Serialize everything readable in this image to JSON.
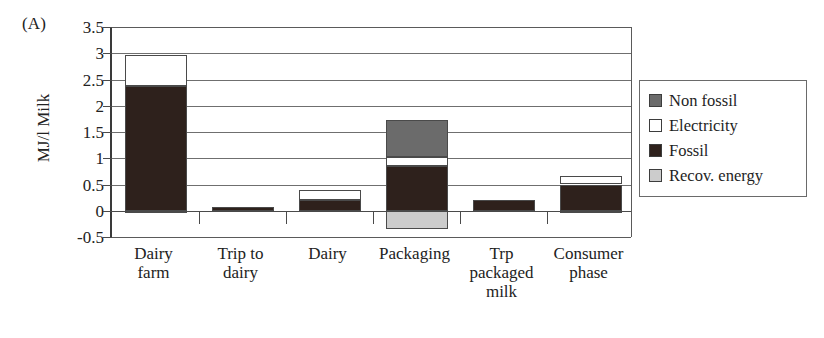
{
  "panel": {
    "label": "(A)"
  },
  "chart_data": {
    "type": "bar",
    "stacked": true,
    "title": "",
    "xlabel": "",
    "ylabel": "MJ/l Milk",
    "ylim": [
      -0.5,
      3.5
    ],
    "ytick_values": [
      3.5,
      3,
      2.5,
      2,
      1.5,
      1,
      0.5,
      0,
      -0.5
    ],
    "ytick_labels": [
      "3.5",
      "3",
      "2.5",
      "2",
      "1.5",
      "1",
      "0.5",
      "0",
      "-0.5"
    ],
    "grid": true,
    "legend_position": "right",
    "categories": [
      "Dairy farm",
      "Trip to dairy",
      "Dairy",
      "Packaging",
      "Trp packaged milk",
      "Consumer phase"
    ],
    "category_lines": [
      [
        "Dairy",
        "farm"
      ],
      [
        "Trip to",
        "dairy"
      ],
      [
        "Dairy"
      ],
      [
        "Packaging"
      ],
      [
        "Trp",
        "packaged",
        "milk"
      ],
      [
        "Consumer",
        "phase"
      ]
    ],
    "series": [
      {
        "name": "Non fossil",
        "color": "#6b6b6b",
        "values": [
          0,
          0,
          0,
          0.7,
          0,
          0
        ]
      },
      {
        "name": "Electricity",
        "color": "#ffffff",
        "values": [
          0.59,
          0,
          0.2,
          0.17,
          0,
          0.16
        ]
      },
      {
        "name": "Fossil",
        "color": "#2e211c",
        "values": [
          2.38,
          0.08,
          0.2,
          0.85,
          0.2,
          0.5
        ]
      },
      {
        "name": "Recov. energy",
        "color": "#cccccc",
        "values": [
          -0.05,
          0,
          0,
          -0.35,
          0,
          -0.04
        ]
      }
    ],
    "totals_positive": [
      2.97,
      0.08,
      0.4,
      1.72,
      0.2,
      0.66
    ],
    "totals_negative": [
      -0.05,
      0,
      0,
      -0.35,
      0,
      -0.04
    ]
  },
  "legend": {
    "items": [
      {
        "label": "Non fossil",
        "swatch": "nonfossil",
        "color": "#6b6b6b"
      },
      {
        "label": "Electricity",
        "swatch": "electricity",
        "color": "#ffffff"
      },
      {
        "label": "Fossil",
        "swatch": "fossil",
        "color": "#2e211c"
      },
      {
        "label": "Recov. energy",
        "swatch": "recov",
        "color": "#cccccc"
      }
    ]
  }
}
